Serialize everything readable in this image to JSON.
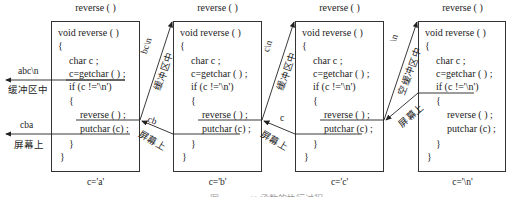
{
  "diagram": {
    "frames": [
      {
        "title": "reverse ( )",
        "lines": [
          "void reverse ( )",
          "{",
          "char c ;",
          "c=getchar ( ) ;",
          "if (c !='\\n')",
          "{",
          "reverse ( ) ;",
          "putchar (c) ;",
          "}",
          "}"
        ],
        "value": "c='a'"
      },
      {
        "title": "reverse ( )",
        "lines": [
          "void reverse ( )",
          "{",
          "char c ;",
          "c=getchar ( ) ;",
          "if (c !='\\n')",
          "{",
          "reverse ( ) ;",
          "putchar (c) ;",
          "}",
          "}"
        ],
        "value": "c='b'"
      },
      {
        "title": "reverse ( )",
        "lines": [
          "void reverse ( )",
          "{",
          "char c ;",
          "c=getchar ( ) ;",
          "if (c !='\\n')",
          "{",
          "reverse ( ) ;",
          "putchar (c) ;",
          "}",
          "}"
        ],
        "value": "c='c'"
      },
      {
        "title": "reverse ( )",
        "lines": [
          "void reverse ( )",
          "{",
          "char c ;",
          "c=getchar ( ) ;",
          "if (c !='\\n')",
          "{",
          "reverse ( ) ;",
          "putchar (c) ;",
          "}",
          "}"
        ],
        "value": "c='\\n'"
      }
    ],
    "left_labels": {
      "input_text": "abc\\n",
      "input_where": "缓冲区中",
      "output_text": "cba",
      "output_where": "屏幕上"
    },
    "arrows": [
      {
        "call_label": "bc\\n",
        "call_where": "缓冲区中",
        "return_label": "cb",
        "return_where": "屏幕上"
      },
      {
        "call_label": "c\\n",
        "call_where": "缓冲区中",
        "return_label": "c",
        "return_where": "屏幕上"
      },
      {
        "call_label": "\\n",
        "call_where": "空缓冲区中",
        "return_label": "",
        "return_where": "屏幕上"
      }
    ],
    "caption": "图 reverse ( ) 函数的执行过程"
  }
}
